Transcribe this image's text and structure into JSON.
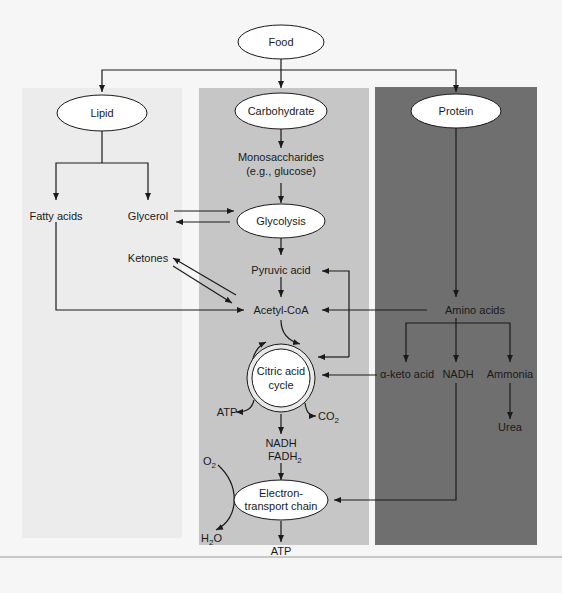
{
  "diagram": {
    "colors": {
      "page_bg": "#f6f6f6",
      "lipid_panel": "#ececec",
      "carbohydrate_panel": "#c6c6c6",
      "protein_panel": "#6f6f6f",
      "node_fill": "#ffffff",
      "line": "#1a1a1a"
    },
    "nodes": {
      "food": "Food",
      "lipid": "Lipid",
      "carbohydrate": "Carbohydrate",
      "protein": "Protein",
      "monosaccharides_line1": "Monosaccharides",
      "monosaccharides_line2": "(e.g., glucose)",
      "fatty_acids": "Fatty acids",
      "glycerol": "Glycerol",
      "glycolysis": "Glycolysis",
      "ketones": "Ketones",
      "pyruvic_acid": "Pyruvic acid",
      "acetyl_coa": "Acetyl-CoA",
      "amino_acids": "Amino acids",
      "citric_acid_line1": "Citric acid",
      "citric_acid_line2": "cycle",
      "alpha_keto_acid": "α-keto acid",
      "nadh": "NADH",
      "ammonia": "Ammonia",
      "urea": "Urea",
      "atp_cycle": "ATP",
      "co2": "CO",
      "co2_sub": "2",
      "nadh_fadh_line1": "NADH",
      "nadh_fadh_line2": "FADH",
      "nadh_fadh_sub": "2",
      "o2": "O",
      "o2_sub": "2",
      "h2o_h": "H",
      "h2o_sub": "2",
      "h2o_o": "O",
      "etc_line1": "Electron-",
      "etc_line2": "transport chain",
      "atp_final": "ATP"
    },
    "edges": [
      {
        "from": "Food",
        "to": "Lipid"
      },
      {
        "from": "Food",
        "to": "Carbohydrate"
      },
      {
        "from": "Food",
        "to": "Protein"
      },
      {
        "from": "Lipid",
        "to": "Fatty acids"
      },
      {
        "from": "Lipid",
        "to": "Glycerol"
      },
      {
        "from": "Carbohydrate",
        "to": "Monosaccharides"
      },
      {
        "from": "Monosaccharides",
        "to": "Glycolysis"
      },
      {
        "from": "Glycerol",
        "to": "Glycolysis",
        "bidirectional": true
      },
      {
        "from": "Glycolysis",
        "to": "Pyruvic acid"
      },
      {
        "from": "Pyruvic acid",
        "to": "Acetyl-CoA"
      },
      {
        "from": "Fatty acids",
        "to": "Acetyl-CoA"
      },
      {
        "from": "Acetyl-CoA",
        "to": "Ketones",
        "bidirectional": true
      },
      {
        "from": "Protein",
        "to": "Amino acids"
      },
      {
        "from": "Amino acids",
        "to": "Acetyl-CoA"
      },
      {
        "from": "Amino acids",
        "to": "Pyruvic acid"
      },
      {
        "from": "Amino acids",
        "to": "Citric acid cycle"
      },
      {
        "from": "Amino acids",
        "to": "α-keto acid"
      },
      {
        "from": "Amino acids",
        "to": "NADH"
      },
      {
        "from": "Amino acids",
        "to": "Ammonia"
      },
      {
        "from": "Ammonia",
        "to": "Urea"
      },
      {
        "from": "α-keto acid",
        "to": "Citric acid cycle"
      },
      {
        "from": "Acetyl-CoA",
        "to": "Citric acid cycle"
      },
      {
        "from": "Citric acid cycle",
        "to": "ATP"
      },
      {
        "from": "Citric acid cycle",
        "to": "CO2"
      },
      {
        "from": "Citric acid cycle",
        "to": "NADH FADH2"
      },
      {
        "from": "NADH FADH2",
        "to": "Electron-transport chain"
      },
      {
        "from": "NADH",
        "to": "Electron-transport chain"
      },
      {
        "from": "O2",
        "to": "H2O"
      },
      {
        "from": "Electron-transport chain",
        "to": "ATP"
      }
    ]
  }
}
